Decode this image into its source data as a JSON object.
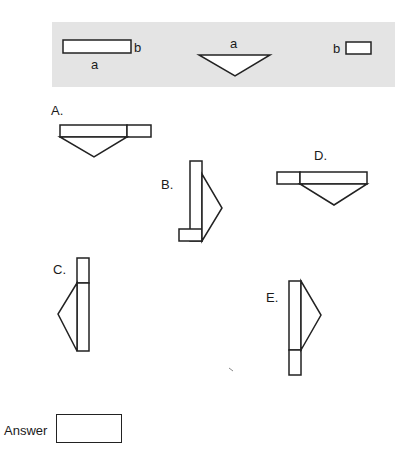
{
  "key": {
    "rect_long": {
      "width_label": "a",
      "height_label": "b"
    },
    "triangle": {
      "side_label": "a"
    },
    "rect_small": {
      "side_label": "b"
    }
  },
  "options": [
    {
      "id": "A",
      "label": "A."
    },
    {
      "id": "B",
      "label": "B."
    },
    {
      "id": "C",
      "label": "C."
    },
    {
      "id": "D",
      "label": "D."
    },
    {
      "id": "E",
      "label": "E."
    }
  ],
  "answer": {
    "label": "Answer",
    "value": ""
  },
  "colors": {
    "panel": "#e4e4e4",
    "stroke": "#222222",
    "fill": "#ffffff"
  }
}
